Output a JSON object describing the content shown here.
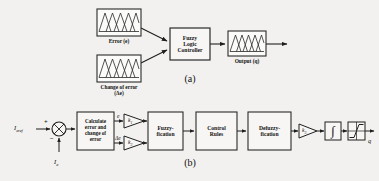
{
  "figure": {
    "background_color": "#f2f1ef",
    "line_color": "#2a2a2a",
    "box_fill": "#f7f6f4"
  },
  "panel_a": {
    "label": "(a)",
    "blocks": [
      {
        "id": "error-mf",
        "kind": "membership-function-plot",
        "caption": "Error (e)",
        "x": 97,
        "y": 9,
        "w": 44,
        "h": 27,
        "triangles": 4
      },
      {
        "id": "change-of-error-mf",
        "kind": "membership-function-plot",
        "caption": "Change of error\n(Δe)",
        "x": 97,
        "y": 55,
        "w": 44,
        "h": 27,
        "triangles": 4
      },
      {
        "id": "fuzzy-logic-controller",
        "kind": "process-block",
        "label": "Fuzzy\nLogic\nController",
        "x": 170,
        "y": 28,
        "w": 40,
        "h": 32
      },
      {
        "id": "output-mf",
        "kind": "membership-function-plot",
        "caption": "Output (q)",
        "x": 228,
        "y": 31,
        "w": 38,
        "h": 25,
        "triangles": 4
      }
    ],
    "connections": [
      {
        "from": "error-mf",
        "to": "fuzzy-logic-controller",
        "arrow": true
      },
      {
        "from": "change-of-error-mf",
        "to": "fuzzy-logic-controller",
        "arrow": true
      },
      {
        "from": "fuzzy-logic-controller",
        "to": "output-mf",
        "arrow": true
      },
      {
        "from": "output-mf",
        "to": "open-end",
        "arrow": true
      }
    ]
  },
  "panel_b": {
    "label": "(b)",
    "inputs": {
      "reference": "I",
      "reference_sub": "aref",
      "feedback": "I",
      "feedback_sub": "a",
      "plus_sign": "+",
      "minus_sign": "−"
    },
    "signals": {
      "error": "e",
      "change_of_error": "Δe",
      "output": "q"
    },
    "blocks": [
      {
        "id": "summing-junction",
        "kind": "summing-junction",
        "label": "",
        "cx": 59,
        "cy": 129,
        "r": 7
      },
      {
        "id": "calculate-error-block",
        "kind": "process-block",
        "label": "Calculate\nerror and\nchange of\nerror",
        "x": 77,
        "y": 112,
        "w": 37,
        "h": 38
      },
      {
        "id": "gain-k1",
        "kind": "gain-triangle",
        "label": "k",
        "sub": "1",
        "x": 124,
        "y": 114,
        "w": 20,
        "h": 14
      },
      {
        "id": "gain-k2",
        "kind": "gain-triangle",
        "label": "k",
        "sub": "2",
        "x": 124,
        "y": 136,
        "w": 20,
        "h": 14
      },
      {
        "id": "fuzzification-block",
        "kind": "process-block",
        "label": "Fuzzy-\nfication",
        "x": 148,
        "y": 112,
        "w": 35,
        "h": 38
      },
      {
        "id": "control-rules-block",
        "kind": "process-block",
        "label": "Control\nRules",
        "x": 196,
        "y": 112,
        "w": 41,
        "h": 38
      },
      {
        "id": "defuzzification-block",
        "kind": "process-block",
        "label": "Defuzzy-\nfication",
        "x": 248,
        "y": 112,
        "w": 43,
        "h": 38
      },
      {
        "id": "gain-k3",
        "kind": "gain-triangle",
        "label": "k",
        "sub": "3",
        "x": 299,
        "y": 124,
        "w": 18,
        "h": 14
      },
      {
        "id": "integrator-block",
        "kind": "integrator",
        "label": "∫",
        "x": 325,
        "y": 122,
        "w": 16,
        "h": 18
      },
      {
        "id": "limiter-block",
        "kind": "saturation-limiter",
        "label": "",
        "x": 348,
        "y": 122,
        "w": 17,
        "h": 18
      }
    ],
    "connections": [
      {
        "from": "reference-input",
        "to": "summing-junction",
        "arrow": true
      },
      {
        "from": "feedback-input",
        "to": "summing-junction",
        "arrow": true
      },
      {
        "from": "summing-junction",
        "to": "calculate-error-block",
        "arrow": true
      },
      {
        "from": "calculate-error-block",
        "to": "gain-k1",
        "arrow": true
      },
      {
        "from": "calculate-error-block",
        "to": "gain-k2",
        "arrow": true
      },
      {
        "from": "gain-k1",
        "to": "fuzzification-block",
        "arrow": true
      },
      {
        "from": "gain-k2",
        "to": "fuzzification-block",
        "arrow": true
      },
      {
        "from": "fuzzification-block",
        "to": "control-rules-block",
        "arrow": true
      },
      {
        "from": "control-rules-block",
        "to": "defuzzification-block",
        "arrow": true
      },
      {
        "from": "defuzzification-block",
        "to": "gain-k3",
        "arrow": true
      },
      {
        "from": "gain-k3",
        "to": "integrator-block",
        "arrow": true
      },
      {
        "from": "integrator-block",
        "to": "limiter-block",
        "arrow": true
      },
      {
        "from": "limiter-block",
        "to": "output-q",
        "arrow": true
      }
    ]
  }
}
